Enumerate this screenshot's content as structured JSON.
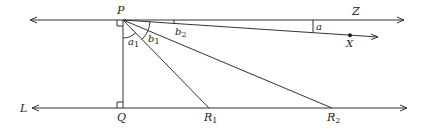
{
  "diagram": {
    "type": "geometry",
    "points": {
      "P": {
        "label": "P",
        "x": 123,
        "y": 20
      },
      "Q": {
        "label": "Q",
        "x": 123,
        "y": 108
      },
      "R1": {
        "label": "R",
        "sub": "1",
        "x": 209,
        "y": 108
      },
      "R2": {
        "label": "R",
        "sub": "2",
        "x": 332,
        "y": 108
      },
      "X": {
        "label": "X",
        "x": 350,
        "y": 36
      }
    },
    "lines": {
      "Z": {
        "label": "Z",
        "desc": "line through P parallel to L"
      },
      "L": {
        "label": "L",
        "desc": "bottom line"
      }
    },
    "angles": {
      "a1": {
        "label": "a",
        "sub": "1"
      },
      "b1": {
        "label": "b",
        "sub": "1"
      },
      "b2": {
        "label": "b",
        "sub": "2"
      },
      "a": {
        "label": "a"
      }
    },
    "colors": {
      "stroke": "#333333",
      "text": "#222222",
      "background": "#ffffff"
    }
  }
}
